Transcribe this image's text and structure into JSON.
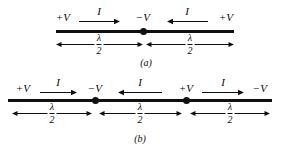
{
  "figure": {
    "background_color": "#ffffff",
    "ink_color": "#101010",
    "panels": [
      {
        "caption": "(a)",
        "caption_x": 146,
        "caption_y": 58,
        "line": {
          "x": 56,
          "y": 30,
          "width": 178
        },
        "nodes": [
          {
            "x": 143
          }
        ],
        "voltage_labels": [
          {
            "text": "+V",
            "x": 63,
            "y": 12
          },
          {
            "text": "−V",
            "x": 143,
            "y": 12
          },
          {
            "text": "+V",
            "x": 226,
            "y": 12
          }
        ],
        "current_labels": [
          {
            "text": "I",
            "x": 99,
            "y": 6,
            "direction": "right",
            "arrow_x": 79,
            "arrow_y": 17,
            "arrow_width": 41
          },
          {
            "text": "I",
            "x": 187,
            "y": 6,
            "direction": "left",
            "arrow_x": 167,
            "arrow_y": 17,
            "arrow_width": 41
          }
        ],
        "dimensions": [
          {
            "label_num": "λ",
            "label_den": "2",
            "x": 56,
            "y": 40,
            "width": 87,
            "center_x": 99
          },
          {
            "label_num": "λ",
            "label_den": "2",
            "x": 146,
            "y": 40,
            "width": 88,
            "center_x": 190
          }
        ]
      },
      {
        "caption": "(b)",
        "caption_x": 140,
        "caption_y": 134,
        "line": {
          "x": 8,
          "y": 99,
          "width": 264
        },
        "nodes": [
          {
            "x": 95
          },
          {
            "x": 186
          }
        ],
        "voltage_labels": [
          {
            "text": "+V",
            "x": 23,
            "y": 83
          },
          {
            "text": "−V",
            "x": 95,
            "y": 83
          },
          {
            "text": "+V",
            "x": 186,
            "y": 83
          },
          {
            "text": "−V",
            "x": 260,
            "y": 83
          }
        ],
        "current_labels": [
          {
            "text": "I",
            "x": 58,
            "y": 77,
            "direction": "right",
            "arrow_x": 40,
            "arrow_y": 88,
            "arrow_width": 37
          },
          {
            "text": "I",
            "x": 140,
            "y": 77,
            "direction": "left",
            "arrow_x": 118,
            "arrow_y": 88,
            "arrow_width": 44
          },
          {
            "text": "I",
            "x": 223,
            "y": 77,
            "direction": "right",
            "arrow_x": 202,
            "arrow_y": 88,
            "arrow_width": 42
          }
        ],
        "dimensions": [
          {
            "label_num": "λ",
            "label_den": "2",
            "x": 12,
            "y": 109,
            "width": 80,
            "center_x": 52
          },
          {
            "label_num": "λ",
            "label_den": "2",
            "x": 99,
            "y": 109,
            "width": 83,
            "center_x": 140
          },
          {
            "label_num": "λ",
            "label_den": "2",
            "x": 190,
            "y": 109,
            "width": 80,
            "center_x": 230
          }
        ]
      }
    ]
  }
}
